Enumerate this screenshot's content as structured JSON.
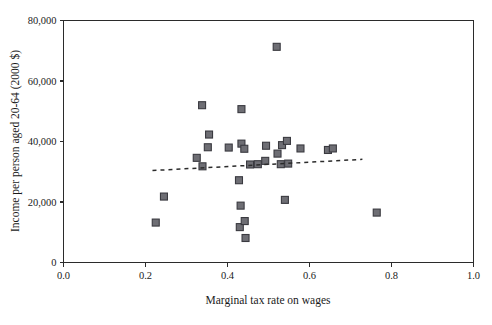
{
  "chart_data": {
    "type": "scatter",
    "title": "",
    "xlabel": "Marginal tax rate on wages",
    "ylabel": "Income per person aged 20-64 (2000 $)",
    "xlim": [
      0.0,
      1.0
    ],
    "ylim": [
      0,
      80000
    ],
    "xticks": [
      "0.0",
      "0.2",
      "0.4",
      "0.6",
      "0.8",
      "1.0"
    ],
    "xtick_values": [
      0.0,
      0.2,
      0.4,
      0.6,
      0.8,
      1.0
    ],
    "yticks": [
      "0",
      "20,000",
      "40,000",
      "60,000",
      "80,000"
    ],
    "ytick_values": [
      0,
      20000,
      40000,
      60000,
      80000
    ],
    "grid": false,
    "legend": "none",
    "marker_shape": "square",
    "marker_color": "#6e6e74",
    "marker_edge_color": "#3a3a40",
    "points": [
      {
        "x": 0.225,
        "y": 13200
      },
      {
        "x": 0.245,
        "y": 21800
      },
      {
        "x": 0.338,
        "y": 52000
      },
      {
        "x": 0.325,
        "y": 34600
      },
      {
        "x": 0.352,
        "y": 38100
      },
      {
        "x": 0.339,
        "y": 31800
      },
      {
        "x": 0.355,
        "y": 42300
      },
      {
        "x": 0.403,
        "y": 38000
      },
      {
        "x": 0.434,
        "y": 39300
      },
      {
        "x": 0.441,
        "y": 37600
      },
      {
        "x": 0.434,
        "y": 50700
      },
      {
        "x": 0.428,
        "y": 27200
      },
      {
        "x": 0.432,
        "y": 18800
      },
      {
        "x": 0.43,
        "y": 11700
      },
      {
        "x": 0.442,
        "y": 13700
      },
      {
        "x": 0.444,
        "y": 8100
      },
      {
        "x": 0.455,
        "y": 32400
      },
      {
        "x": 0.474,
        "y": 32500
      },
      {
        "x": 0.494,
        "y": 38600
      },
      {
        "x": 0.492,
        "y": 33600
      },
      {
        "x": 0.52,
        "y": 71300
      },
      {
        "x": 0.522,
        "y": 36000
      },
      {
        "x": 0.533,
        "y": 38800
      },
      {
        "x": 0.545,
        "y": 40200
      },
      {
        "x": 0.53,
        "y": 32500
      },
      {
        "x": 0.548,
        "y": 32700
      },
      {
        "x": 0.54,
        "y": 20700
      },
      {
        "x": 0.578,
        "y": 37700
      },
      {
        "x": 0.645,
        "y": 37200
      },
      {
        "x": 0.657,
        "y": 37700
      },
      {
        "x": 0.764,
        "y": 16500
      }
    ],
    "trend_line": {
      "style": "dashed",
      "x_start": 0.217,
      "y_start": 30400,
      "x_end": 0.729,
      "y_end": 34100
    }
  },
  "axes": {
    "y_axis_title": "Income per person aged 20-64 (2000 $)",
    "x_axis_title": "Marginal tax rate on wages"
  }
}
